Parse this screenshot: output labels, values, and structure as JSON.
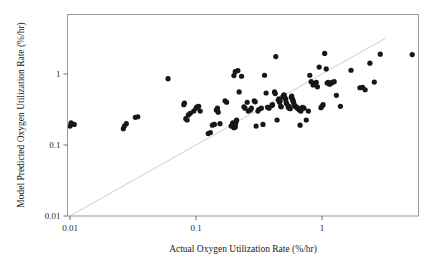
{
  "chart_data": {
    "type": "scatter",
    "title": "",
    "xlabel": "Actual Oxygen Utilization Rate (%/hr)",
    "ylabel": "Model Predicted Oxygen Utilization Rate (%/hr)",
    "xscale": "log",
    "yscale": "log",
    "xlim": [
      0.01,
      5.6
    ],
    "ylim": [
      0.01,
      3.2
    ],
    "xticks": [
      0.01,
      0.1,
      1
    ],
    "xtick_labels": [
      "0.01",
      "0.1",
      "1"
    ],
    "yticks": [
      0.01,
      0.1,
      1
    ],
    "ytick_labels": [
      "0.01",
      "0.1",
      "1"
    ],
    "grid": false,
    "legend": null,
    "marker": "filled-circle",
    "marker_color": "#171717",
    "marker_size_px": 5.2,
    "reference_line": {
      "name": "one-to-one-line",
      "type": "identity",
      "from": [
        0.01,
        0.01
      ],
      "to": [
        3.2,
        3.2
      ],
      "color": "#cfcfcf",
      "style": "solid"
    },
    "n_points": 131,
    "points": [
      [
        0.01,
        0.185
      ],
      [
        0.0102,
        0.205
      ],
      [
        0.0108,
        0.195
      ],
      [
        0.0265,
        0.17
      ],
      [
        0.027,
        0.185
      ],
      [
        0.028,
        0.2
      ],
      [
        0.033,
        0.245
      ],
      [
        0.0345,
        0.25
      ],
      [
        0.06,
        0.86
      ],
      [
        0.08,
        0.37
      ],
      [
        0.081,
        0.39
      ],
      [
        0.083,
        0.235
      ],
      [
        0.085,
        0.225
      ],
      [
        0.087,
        0.265
      ],
      [
        0.09,
        0.28
      ],
      [
        0.096,
        0.3
      ],
      [
        0.1,
        0.33
      ],
      [
        0.102,
        0.345
      ],
      [
        0.105,
        0.35
      ],
      [
        0.108,
        0.3
      ],
      [
        0.125,
        0.145
      ],
      [
        0.13,
        0.15
      ],
      [
        0.135,
        0.19
      ],
      [
        0.14,
        0.195
      ],
      [
        0.145,
        0.31
      ],
      [
        0.148,
        0.33
      ],
      [
        0.15,
        0.29
      ],
      [
        0.155,
        0.2
      ],
      [
        0.17,
        0.42
      ],
      [
        0.175,
        0.4
      ],
      [
        0.19,
        0.185
      ],
      [
        0.195,
        0.195
      ],
      [
        0.196,
        0.205
      ],
      [
        0.198,
        0.19
      ],
      [
        0.2,
        0.175
      ],
      [
        0.205,
        0.18
      ],
      [
        0.206,
        0.2
      ],
      [
        0.208,
        0.215
      ],
      [
        0.21,
        0.225
      ],
      [
        0.2,
        0.95
      ],
      [
        0.205,
        1.08
      ],
      [
        0.215,
        1.12
      ],
      [
        0.23,
        0.93
      ],
      [
        0.24,
        0.345
      ],
      [
        0.245,
        0.33
      ],
      [
        0.255,
        0.4
      ],
      [
        0.26,
        0.3
      ],
      [
        0.27,
        0.31
      ],
      [
        0.275,
        0.33
      ],
      [
        0.29,
        0.42
      ],
      [
        0.295,
        0.405
      ],
      [
        0.31,
        0.3
      ],
      [
        0.315,
        0.315
      ],
      [
        0.33,
        0.33
      ],
      [
        0.34,
        0.195
      ],
      [
        0.35,
        0.96
      ],
      [
        0.36,
        0.54
      ],
      [
        0.37,
        0.34
      ],
      [
        0.38,
        0.33
      ],
      [
        0.4,
        0.36
      ],
      [
        0.405,
        0.37
      ],
      [
        0.42,
        0.56
      ],
      [
        0.425,
        0.53
      ],
      [
        0.43,
        1.76
      ],
      [
        0.44,
        0.225
      ],
      [
        0.45,
        0.43
      ],
      [
        0.455,
        0.445
      ],
      [
        0.46,
        0.4
      ],
      [
        0.465,
        0.415
      ],
      [
        0.47,
        0.35
      ],
      [
        0.475,
        0.345
      ],
      [
        0.49,
        0.48
      ],
      [
        0.495,
        0.5
      ],
      [
        0.5,
        0.51
      ],
      [
        0.505,
        0.47
      ],
      [
        0.51,
        0.455
      ],
      [
        0.515,
        0.44
      ],
      [
        0.52,
        0.395
      ],
      [
        0.525,
        0.38
      ],
      [
        0.54,
        0.34
      ],
      [
        0.545,
        0.35
      ],
      [
        0.55,
        0.33
      ],
      [
        0.56,
        0.325
      ],
      [
        0.57,
        0.47
      ],
      [
        0.575,
        0.49
      ],
      [
        0.58,
        0.45
      ],
      [
        0.585,
        0.435
      ],
      [
        0.59,
        0.415
      ],
      [
        0.595,
        0.4
      ],
      [
        0.6,
        0.37
      ],
      [
        0.61,
        0.355
      ],
      [
        0.62,
        0.345
      ],
      [
        0.63,
        0.34
      ],
      [
        0.64,
        0.33
      ],
      [
        0.65,
        0.325
      ],
      [
        0.66,
        0.31
      ],
      [
        0.68,
        0.3
      ],
      [
        0.7,
        0.34
      ],
      [
        0.72,
        0.33
      ],
      [
        0.75,
        0.225
      ],
      [
        0.78,
        0.3
      ],
      [
        0.8,
        0.96
      ],
      [
        0.82,
        0.78
      ],
      [
        0.85,
        0.7
      ],
      [
        0.87,
        0.73
      ],
      [
        0.9,
        0.76
      ],
      [
        0.92,
        0.66
      ],
      [
        0.95,
        1.25
      ],
      [
        0.98,
        0.335
      ],
      [
        1.0,
        0.35
      ],
      [
        1.02,
        0.37
      ],
      [
        1.05,
        1.95
      ],
      [
        1.08,
        1.18
      ],
      [
        1.1,
        0.745
      ],
      [
        1.12,
        0.76
      ],
      [
        1.15,
        0.72
      ],
      [
        1.18,
        0.74
      ],
      [
        1.2,
        0.76
      ],
      [
        1.25,
        0.78
      ],
      [
        1.3,
        0.5
      ],
      [
        1.4,
        0.35
      ],
      [
        1.7,
        1.13
      ],
      [
        2.0,
        0.64
      ],
      [
        2.1,
        0.65
      ],
      [
        2.2,
        0.6
      ],
      [
        2.4,
        1.42
      ],
      [
        2.6,
        0.77
      ],
      [
        2.9,
        1.9
      ],
      [
        5.2,
        1.88
      ],
      [
        0.22,
        0.56
      ],
      [
        0.3,
        0.185
      ],
      [
        0.67,
        0.19
      ]
    ]
  },
  "axes": {
    "x_title": "Actual Oxygen Utilization Rate (%/hr)",
    "y_title": "Model Predicted Oxygen Utilization Rate (%/hr)"
  }
}
